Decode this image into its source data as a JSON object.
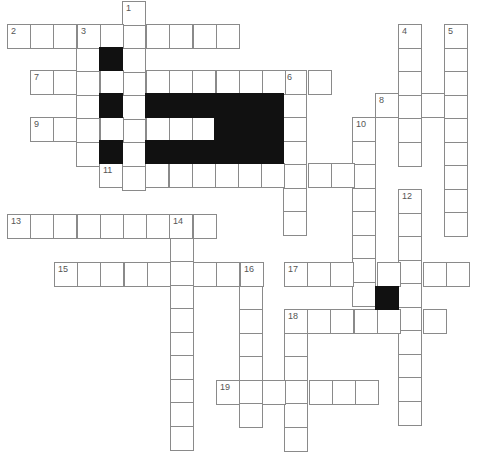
{
  "puzzle": {
    "type": "crossword",
    "cell_w": 23.2,
    "cell_h": 23.5,
    "colors": {
      "line": "#8a8a8a",
      "fill": "#ffffff",
      "block": "#111111",
      "number": "#555555"
    },
    "words": [
      {
        "number": "1",
        "dir": "down",
        "x": 122,
        "y": 1,
        "len": 8
      },
      {
        "number": "2",
        "dir": "across",
        "x": 7,
        "y": 24,
        "len": 10
      },
      {
        "number": "3",
        "dir": "down",
        "x": 76,
        "y": 24,
        "len": 6
      },
      {
        "number": "4",
        "dir": "down",
        "x": 398,
        "y": 24,
        "len": 6
      },
      {
        "number": "5",
        "dir": "down",
        "x": 444,
        "y": 24,
        "len": 9
      },
      {
        "number": "6",
        "dir": "down",
        "x": 283,
        "y": 70,
        "len": 7
      },
      {
        "number": "7",
        "dir": "across",
        "x": 30,
        "y": 70,
        "len": 13
      },
      {
        "number": "8",
        "dir": "across",
        "x": 375,
        "y": 93,
        "len": 4
      },
      {
        "number": "9",
        "dir": "across",
        "x": 30,
        "y": 117,
        "len": 8
      },
      {
        "number": "10",
        "dir": "down",
        "x": 352,
        "y": 117,
        "len": 8
      },
      {
        "number": "11",
        "dir": "across",
        "x": 99,
        "y": 163,
        "len": 12
      },
      {
        "number": "12",
        "dir": "down",
        "x": 398,
        "y": 189,
        "len": 10
      },
      {
        "number": "13",
        "dir": "across",
        "x": 7,
        "y": 214,
        "len": 9
      },
      {
        "number": "14",
        "dir": "down",
        "x": 170,
        "y": 214,
        "len": 10
      },
      {
        "number": "15",
        "dir": "across",
        "x": 54,
        "y": 262,
        "len": 9
      },
      {
        "number": "16",
        "dir": "down",
        "x": 239,
        "y": 262,
        "len": 7
      },
      {
        "number": "17",
        "dir": "across",
        "x": 284,
        "y": 262,
        "len": 8
      },
      {
        "number": "18",
        "dir": "across",
        "x": 284,
        "y": 309,
        "len": 7
      },
      {
        "number": "18d",
        "dir": "down",
        "x": 284,
        "y": 309,
        "len": 6,
        "unnumbered": true
      },
      {
        "number": "19",
        "dir": "across",
        "x": 216,
        "y": 380,
        "len": 7
      }
    ],
    "blocks": [
      {
        "x": 99,
        "y": 47,
        "w": 23,
        "h": 23
      },
      {
        "x": 99,
        "y": 93,
        "w": 23,
        "h": 24
      },
      {
        "x": 99,
        "y": 140,
        "w": 23,
        "h": 23
      },
      {
        "x": 145,
        "y": 93,
        "w": 138,
        "h": 24
      },
      {
        "x": 214,
        "y": 117,
        "w": 69,
        "h": 23
      },
      {
        "x": 145,
        "y": 140,
        "w": 138,
        "h": 23
      },
      {
        "x": 375,
        "y": 286,
        "w": 23,
        "h": 23
      }
    ]
  }
}
